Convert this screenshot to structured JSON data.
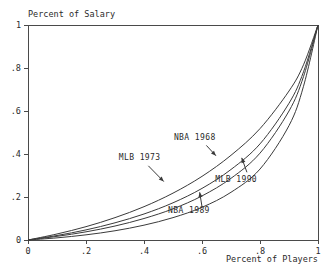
{
  "chart_data": {
    "type": "line",
    "title": "Percent of Salary",
    "xlabel": "Percent of Players",
    "ylabel": "Percent of Salary",
    "xlim": [
      0,
      1
    ],
    "ylim": [
      0,
      1
    ],
    "grid": false,
    "legend_position": "inline-annotations",
    "x_ticks": [
      "0",
      ".2",
      ".4",
      ".6",
      ".8",
      "1"
    ],
    "x_tick_values": [
      0,
      0.2,
      0.4,
      0.6,
      0.8,
      1
    ],
    "y_ticks": [
      "0",
      ".2",
      ".4",
      ".6",
      ".8",
      "1"
    ],
    "y_tick_values": [
      0,
      0.2,
      0.4,
      0.6,
      0.8,
      1
    ],
    "x": [
      0,
      0.1,
      0.2,
      0.3,
      0.4,
      0.5,
      0.6,
      0.7,
      0.8,
      0.9,
      0.95,
      1
    ],
    "series": [
      {
        "name": "NBA 1968",
        "values": [
          0,
          0.028,
          0.062,
          0.104,
          0.155,
          0.218,
          0.296,
          0.394,
          0.518,
          0.693,
          0.815,
          1
        ],
        "label_x": 0.575,
        "label_y": 0.465,
        "arrow_from_x": 0.615,
        "arrow_from_y": 0.44,
        "arrow_to_x": 0.648,
        "arrow_to_y": 0.392
      },
      {
        "name": "MLB 1973",
        "values": [
          0,
          0.021,
          0.047,
          0.08,
          0.121,
          0.173,
          0.24,
          0.328,
          0.447,
          0.636,
          0.782,
          1
        ],
        "label_x": 0.385,
        "label_y": 0.372,
        "arrow_from_x": 0.415,
        "arrow_from_y": 0.345,
        "arrow_to_x": 0.468,
        "arrow_to_y": 0.272
      },
      {
        "name": "NBA 1989",
        "values": [
          0,
          0.017,
          0.038,
          0.065,
          0.1,
          0.145,
          0.205,
          0.287,
          0.404,
          0.6,
          0.76,
          1
        ],
        "label_x": 0.555,
        "label_y": 0.124,
        "arrow_from_x": 0.6,
        "arrow_from_y": 0.155,
        "arrow_to_x": 0.592,
        "arrow_to_y": 0.222
      },
      {
        "name": "MLB 1990",
        "values": [
          0,
          0.01,
          0.024,
          0.043,
          0.069,
          0.104,
          0.152,
          0.222,
          0.33,
          0.532,
          0.715,
          1
        ],
        "label_x": 0.718,
        "label_y": 0.272,
        "arrow_from_x": 0.755,
        "arrow_from_y": 0.315,
        "arrow_to_x": 0.737,
        "arrow_to_y": 0.382
      }
    ]
  }
}
